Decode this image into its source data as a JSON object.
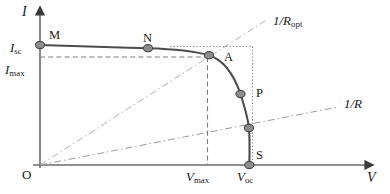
{
  "figure": {
    "type": "diagram",
    "axes": {
      "y_axis": {
        "name": "I",
        "label": "I",
        "arrow": "up"
      },
      "x_axis": {
        "name": "V",
        "label": "V",
        "arrow": "right"
      },
      "origin_label": "O"
    },
    "y_tick_labels": [
      {
        "base": "I",
        "sub": "sc",
        "value_y": 47
      },
      {
        "base": "I",
        "sub": "max",
        "value_y": 70
      }
    ],
    "x_tick_labels": [
      {
        "base": "V",
        "sub": "max",
        "value_x": 207
      },
      {
        "base": "V",
        "sub": "oc",
        "value_x": 249
      }
    ],
    "curve_points": [
      {
        "label": "M",
        "x": 40,
        "y": 45
      },
      {
        "label": "N",
        "x": 148,
        "y": 48
      },
      {
        "label": "A",
        "x": 209,
        "y": 55
      },
      {
        "label": "P",
        "x": 240,
        "y": 94
      },
      {
        "label": "",
        "x": 249,
        "y": 128
      },
      {
        "label": "S",
        "x": 249,
        "y": 165
      }
    ],
    "load_lines": [
      {
        "base": "1/R",
        "sub": "opt",
        "name": "optimal-load-line"
      },
      {
        "base": "1/R",
        "sub": "",
        "name": "load-line"
      }
    ],
    "colors": {
      "curve": "#4d4d4d",
      "axis": "#6b6b6b",
      "guide": "#9a9a9a",
      "marker_fill": "#8e8e8e",
      "marker_stroke": "#4a4a4a",
      "text": "#1a1a1a"
    }
  }
}
